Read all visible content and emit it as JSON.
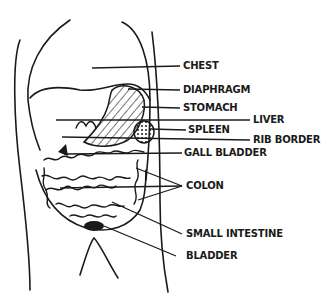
{
  "diagram": {
    "labels": [
      {
        "id": "chest",
        "text": "CHEST",
        "x": 183,
        "y": 60
      },
      {
        "id": "diaphragm",
        "text": "DIAPHRAGM",
        "x": 183,
        "y": 84
      },
      {
        "id": "stomach",
        "text": "STOMACH",
        "x": 183,
        "y": 102
      },
      {
        "id": "liver",
        "text": "LIVER",
        "x": 255,
        "y": 114
      },
      {
        "id": "spleen",
        "text": "SPLEEN",
        "x": 188,
        "y": 124
      },
      {
        "id": "rib_border",
        "text": "RIB BORDER",
        "x": 255,
        "y": 134
      },
      {
        "id": "gall_bladder",
        "text": "GALL BLADDER",
        "x": 184,
        "y": 147
      },
      {
        "id": "colon",
        "text": "COLON",
        "x": 186,
        "y": 180
      },
      {
        "id": "small_intestine",
        "text": "SMALL INTESTINE",
        "x": 186,
        "y": 228
      },
      {
        "id": "bladder",
        "text": "BLADDER",
        "x": 186,
        "y": 250
      }
    ],
    "colors": {
      "ink": "#1a1a1a",
      "background": "#ffffff"
    }
  }
}
